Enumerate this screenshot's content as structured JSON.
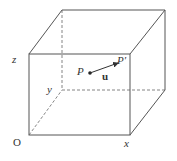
{
  "diagram": {
    "type": "3d-box-with-vector",
    "labels": {
      "origin": "O",
      "x_axis": "x",
      "y_axis": "y",
      "z_axis": "z",
      "point_start": "P",
      "point_end": "P′",
      "vector": "u"
    },
    "colors": {
      "line": "#555555",
      "text": "#333333",
      "background": "#ffffff"
    }
  }
}
